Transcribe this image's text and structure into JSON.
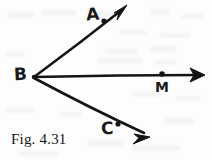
{
  "figure": {
    "caption": "Fig. 4.31",
    "background_color": "#fdfdfd",
    "ink_color": "#141414",
    "width": 212,
    "height": 160
  },
  "labels": {
    "a": "A",
    "b": "B",
    "m": "M",
    "c": "C"
  },
  "geometry": {
    "vertex": {
      "name": "B",
      "x": 33,
      "y": 77
    },
    "rays": [
      {
        "name": "ray-BA",
        "from": {
          "x": 33,
          "y": 77
        },
        "to": {
          "x": 127,
          "y": 6
        },
        "point_label": "A",
        "point": {
          "x": 104,
          "y": 21
        }
      },
      {
        "name": "ray-BM",
        "from": {
          "x": 33,
          "y": 77
        },
        "to": {
          "x": 205,
          "y": 75
        },
        "point_label": "M",
        "point": {
          "x": 162,
          "y": 74
        }
      },
      {
        "name": "ray-BC",
        "from": {
          "x": 33,
          "y": 77
        },
        "to": {
          "x": 150,
          "y": 137
        },
        "point_label": "C",
        "point": {
          "x": 118,
          "y": 124
        }
      }
    ]
  }
}
